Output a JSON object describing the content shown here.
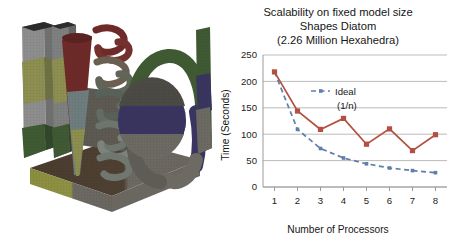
{
  "figure": {
    "model": {
      "caption_hidden": "Shapes Diatom finite element mesh",
      "parts": [
        {
          "name": "base-plate",
          "colors": [
            "#4a3c2e",
            "#8c8f3f",
            "#6d6a63"
          ]
        },
        {
          "name": "left-slab-tall",
          "colors": [
            "#8e8e8e",
            "#8d9050",
            "#3f5a33"
          ]
        },
        {
          "name": "left-slab-inner",
          "colors": [
            "#7f8080",
            "#8d9050",
            "#3f5a33"
          ]
        },
        {
          "name": "cone",
          "colors": [
            "#6e2a28",
            "#6f7d7e",
            "#8d8f4e"
          ]
        },
        {
          "name": "helix-spring",
          "colors": [
            "#6e2a28",
            "#58605a",
            "#7b837c"
          ]
        },
        {
          "name": "torus",
          "colors": [
            "#3f5a33",
            "#3a3560",
            "#6d6a63"
          ]
        },
        {
          "name": "sphere",
          "colors": [
            "#3a3560",
            "#6d6a63"
          ]
        },
        {
          "name": "right-slab",
          "colors": [
            "#3f5a33",
            "#3a3560",
            "#6d6a63"
          ]
        },
        {
          "name": "back-wall",
          "colors": [
            "#6b675f"
          ]
        }
      ]
    },
    "colors": {
      "measured": "#b35041",
      "ideal": "#5f7fa8",
      "grid": "#b3b3b3",
      "axis": "#9a9a9a",
      "text": "#161616",
      "background": "#ffffff"
    }
  },
  "chart_data": {
    "type": "line",
    "title": "Scalability on fixed model size",
    "subtitle": "Shapes Diatom",
    "subtitle2": "(2.26 Million Hexahedra)",
    "xlabel": "Number of Processors",
    "ylabel": "Time (Seconds)",
    "x": [
      1,
      2,
      3,
      4,
      5,
      6,
      7,
      8
    ],
    "categories": [
      "1",
      "2",
      "3",
      "4",
      "5",
      "6",
      "7",
      "8"
    ],
    "xlim": [
      0.5,
      8.5
    ],
    "ylim": [
      0,
      250
    ],
    "yticks": [
      0,
      50,
      100,
      150,
      200,
      250
    ],
    "ytick_labels": [
      "0",
      "50",
      "100",
      "150",
      "200",
      "250"
    ],
    "grid": "horizontal",
    "legend_position": "inside-upper-center",
    "series": [
      {
        "name": "Measured",
        "color": "#b35041",
        "style": "solid",
        "marker": "square",
        "in_legend": false,
        "values": [
          218,
          144,
          109,
          130,
          81,
          110,
          69,
          99
        ]
      },
      {
        "name": "Ideal",
        "name_line2": "(1/n)",
        "color": "#5f7fa8",
        "style": "dashed",
        "marker": "square",
        "in_legend": true,
        "values": [
          218,
          109,
          73,
          55,
          44,
          36,
          31,
          27
        ]
      }
    ],
    "legend": [
      {
        "label": "Ideal",
        "sublabel": "(1/n)",
        "color": "#5f7fa8",
        "style": "dashed"
      }
    ]
  }
}
